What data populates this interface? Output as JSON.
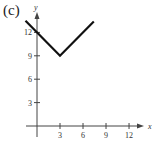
{
  "figure": {
    "panel_label": "(c)"
  },
  "chart_data": {
    "type": "line",
    "title": "",
    "xlabel": "x",
    "ylabel": "y",
    "function": "y = |x - 3| + 9",
    "x": [
      -1.5,
      3,
      7.4
    ],
    "y": [
      13.5,
      9,
      13.4
    ],
    "series": [
      {
        "name": "f(x)",
        "x": [
          -1.5,
          3,
          7.4
        ],
        "y": [
          13.5,
          9,
          13.4
        ]
      }
    ],
    "xticks": [
      3,
      6,
      9,
      12
    ],
    "yticks": [
      3,
      6,
      9,
      12
    ],
    "xlim": [
      -1.5,
      13.5
    ],
    "ylim": [
      -1.5,
      14
    ],
    "grid": false,
    "legend": null
  },
  "axes": {
    "x_label": "x",
    "y_label": "y",
    "x_tick_labels": [
      "3",
      "6",
      "9",
      "12"
    ],
    "y_tick_labels": [
      "3",
      "6",
      "9",
      "12"
    ]
  },
  "colors": {
    "line": "#111111",
    "axis": "#444444"
  }
}
